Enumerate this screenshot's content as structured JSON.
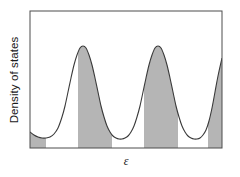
{
  "figure": {
    "title": "",
    "ylabel": "Density of states",
    "xlabel": "ε",
    "frame_color": "#4d4d4d",
    "curve_color": "#3a3a3a",
    "fill_color": "#b5b5b5",
    "background": "#ffffff"
  },
  "chart_data": {
    "type": "line",
    "title": "",
    "xlabel": "ε",
    "ylabel": "Density of states",
    "xlim": [
      0,
      192
    ],
    "ylim": [
      0,
      137
    ],
    "grid": false,
    "legend": null,
    "series": [
      {
        "name": "density-of-states",
        "comment": "Sampled curve in plot-box pixel coordinates, x from left edge of frame, y measured up from bottom axis.",
        "x": [
          0,
          4,
          8,
          12,
          16,
          20,
          24,
          28,
          32,
          35,
          38,
          41,
          44,
          47,
          50,
          53,
          56,
          59,
          62,
          65,
          68,
          71,
          74,
          77,
          80,
          83,
          86,
          89,
          92,
          95,
          98,
          101,
          104,
          107,
          110,
          113,
          116,
          119,
          122,
          125,
          128,
          131,
          134,
          137,
          140,
          143,
          146,
          149,
          152,
          155,
          158,
          161,
          164,
          167,
          170,
          173,
          176,
          179,
          182,
          185,
          188,
          192
        ],
        "y": [
          16,
          13,
          11,
          10,
          10,
          11,
          14,
          20,
          31,
          42,
          56,
          70,
          83,
          93,
          100,
          102,
          100,
          93,
          83,
          70,
          56,
          42,
          31,
          22,
          16,
          12,
          10,
          9,
          9,
          10,
          12,
          16,
          22,
          31,
          42,
          56,
          70,
          83,
          93,
          100,
          102,
          100,
          93,
          83,
          70,
          56,
          42,
          31,
          22,
          16,
          12,
          10,
          9,
          9,
          10,
          13,
          18,
          27,
          40,
          56,
          72,
          90
        ]
      }
    ],
    "peaks": [
      {
        "label": "band-1",
        "x": 35,
        "y": 102
      },
      {
        "label": "band-2",
        "x": 105,
        "y": 102
      },
      {
        "label": "band-3",
        "x": 167,
        "y": 102
      }
    ],
    "shaded_bands": [
      {
        "label": "gap-band-0",
        "x_start": 0,
        "x_end": 16
      },
      {
        "label": "gap-band-1",
        "x_start": 48,
        "x_end": 82
      },
      {
        "label": "gap-band-2",
        "x_start": 114,
        "x_end": 148
      },
      {
        "label": "gap-band-3",
        "x_start": 178,
        "x_end": 192
      }
    ]
  }
}
